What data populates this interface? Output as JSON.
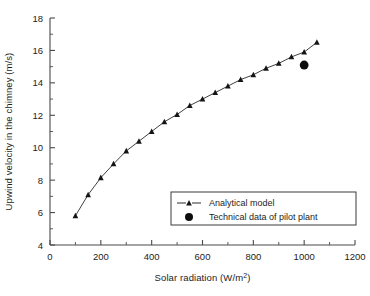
{
  "figure": {
    "background_color": "#ffffff",
    "ink_color": "#1d1d1d"
  },
  "chart_data": {
    "type": "line",
    "title": "",
    "subtitle": "",
    "xlabel": "Solar radiation (W/m2)",
    "xlabel_base": "Solar radiation (W/m",
    "xlabel_sup": "2",
    "xlabel_tail": ")",
    "ylabel": "Upwind velocity in the chimney (m/s)",
    "xlim": [
      0,
      1200
    ],
    "ylim": [
      4,
      18
    ],
    "xticks": [
      0,
      200,
      400,
      600,
      800,
      1000,
      1200
    ],
    "xtick_labels": [
      "0",
      "200",
      "400",
      "600",
      "800",
      "1000",
      "1200"
    ],
    "xminor_step": 100,
    "yticks": [
      4,
      6,
      8,
      10,
      12,
      14,
      16,
      18
    ],
    "ytick_labels": [
      "4",
      "6",
      "8",
      "10",
      "12",
      "14",
      "16",
      "18"
    ],
    "yminor_step": 1,
    "grid": false,
    "legend_position": "lower right",
    "series": [
      {
        "name": "Analytical model",
        "marker": "triangle",
        "line": "solid",
        "color": "#141414",
        "x": [
          100,
          150,
          200,
          250,
          300,
          350,
          400,
          450,
          500,
          550,
          600,
          650,
          700,
          750,
          800,
          850,
          900,
          950,
          1000,
          1050
        ],
        "y": [
          5.8,
          7.1,
          8.15,
          9.0,
          9.8,
          10.4,
          11.0,
          11.6,
          12.05,
          12.6,
          13.0,
          13.4,
          13.8,
          14.2,
          14.5,
          14.9,
          15.2,
          15.6,
          15.9,
          16.5
        ]
      },
      {
        "name": "Technical data of pilot plant",
        "marker": "circle",
        "line": "none",
        "color": "#0d0d0d",
        "x": [
          1000
        ],
        "y": [
          15.1
        ]
      }
    ],
    "legend_entries": [
      {
        "label": "Analytical model",
        "marker": "triangle-with-line"
      },
      {
        "label": "Technical data of pilot plant",
        "marker": "filled-circle"
      }
    ]
  }
}
